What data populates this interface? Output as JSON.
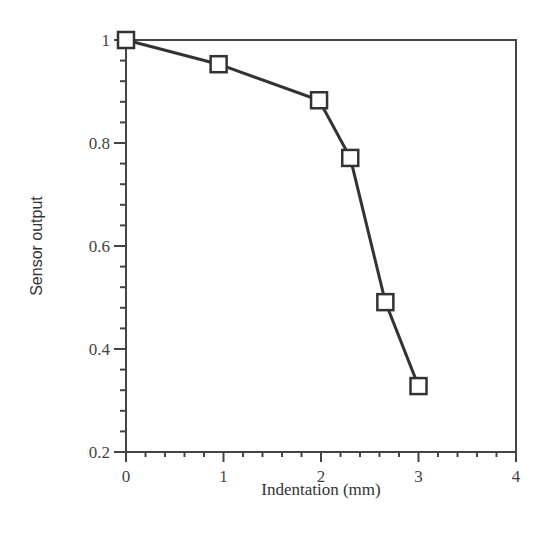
{
  "chart_data": {
    "type": "line",
    "title": "",
    "xlabel": "Indentation (mm)",
    "ylabel": "Sensor output",
    "xlim": [
      0,
      4
    ],
    "ylim": [
      0.2,
      1.0
    ],
    "x_ticks": [
      0,
      1,
      2,
      3,
      4
    ],
    "x_tick_labels": [
      "0",
      "1",
      "2",
      "3",
      "4"
    ],
    "y_ticks": [
      0.2,
      0.4,
      0.6,
      0.8,
      1.0
    ],
    "y_tick_labels": [
      "0.2",
      "0.4",
      "0.6",
      "0.8",
      "1"
    ],
    "grid": false,
    "legend": null,
    "marker": "open-square",
    "series": [
      {
        "name": "Sensor output",
        "x": [
          0,
          0.95,
          1.98,
          2.3,
          2.66,
          3.0
        ],
        "y": [
          1.0,
          0.953,
          0.883,
          0.771,
          0.491,
          0.328
        ]
      }
    ]
  },
  "colors": {
    "line": "#333333",
    "axis": "#444444",
    "marker_fill": "#ffffff",
    "background": "#ffffff"
  }
}
